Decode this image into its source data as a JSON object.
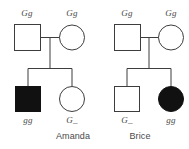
{
  "figure": {
    "type": "pedigree-chart",
    "background_color": "#ffffff",
    "stroke_color": "#3d3d3d",
    "affected_fill_color": "#111111",
    "unaffected_fill_color": "#ffffff",
    "text_color": "#4a4a4a"
  },
  "pedigrees": [
    {
      "id": "amanda",
      "caption": "Amanda",
      "generation1": [
        {
          "label": "Gg",
          "sex": "male",
          "shape": "square",
          "affected": false
        },
        {
          "label": "Gg",
          "sex": "female",
          "shape": "circle",
          "affected": false
        }
      ],
      "generation2": [
        {
          "label": "gg",
          "sex": "male",
          "shape": "square",
          "affected": true
        },
        {
          "label": "G_",
          "sex": "female",
          "shape": "circle",
          "affected": false
        }
      ]
    },
    {
      "id": "brice",
      "caption": "Brice",
      "generation1": [
        {
          "label": "Gg",
          "sex": "male",
          "shape": "square",
          "affected": false
        },
        {
          "label": "Gg",
          "sex": "female",
          "shape": "circle",
          "affected": false
        }
      ],
      "generation2": [
        {
          "label": "G_",
          "sex": "male",
          "shape": "square",
          "affected": false
        },
        {
          "label": "gg",
          "sex": "female",
          "shape": "circle",
          "affected": true
        }
      ]
    }
  ]
}
